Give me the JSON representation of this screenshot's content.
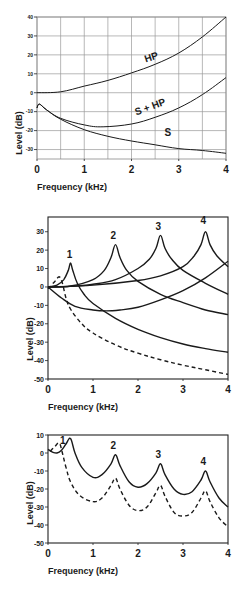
{
  "chart_data": [
    {
      "id": "top",
      "type": "line",
      "title": "",
      "xlabel": "Frequency (kHz)",
      "ylabel": "Level (dB)",
      "xlim": [
        0,
        4
      ],
      "ylim": [
        -35,
        40
      ],
      "xticks": [
        0,
        1,
        2,
        3,
        4
      ],
      "yticks": [
        40,
        30,
        20,
        10,
        0,
        -10,
        -20,
        -30
      ],
      "grid": true,
      "grid_x_step": 0.5,
      "grid_y_step": 10,
      "frame": {
        "left": 37,
        "right": 226,
        "top": 17,
        "bottom": 159
      },
      "series": [
        {
          "name": "HP",
          "style": "solid",
          "label_at": [
            2.3,
            16
          ],
          "label_rotate": -18,
          "x": [
            0,
            0.5,
            1.0,
            1.5,
            2.0,
            2.5,
            3.0,
            3.5,
            4.0
          ],
          "y": [
            0,
            0.5,
            3.5,
            6.5,
            10.5,
            15,
            21,
            29.5,
            40
          ]
        },
        {
          "name": "S + HP",
          "style": "solid",
          "label_at": [
            2.1,
            -12
          ],
          "label_rotate": -20,
          "x": [
            0,
            0.05,
            0.2,
            0.5,
            1.0,
            1.4,
            2.0,
            2.5,
            3.0,
            3.5,
            4.0
          ],
          "y": [
            -8,
            -6,
            -9,
            -13.5,
            -17,
            -18,
            -16.5,
            -13,
            -8,
            -1,
            8
          ]
        },
        {
          "name": "S",
          "style": "solid",
          "label_at": [
            2.7,
            -23
          ],
          "label_rotate": 0,
          "x": [
            0,
            0.05,
            0.2,
            0.5,
            1.0,
            1.5,
            2.0,
            2.5,
            3.0,
            3.5,
            4.0
          ],
          "y": [
            -8,
            -6,
            -9,
            -14,
            -19.5,
            -23,
            -25.5,
            -27.5,
            -29.5,
            -30.5,
            -32
          ]
        }
      ]
    },
    {
      "id": "middle",
      "type": "line",
      "title": "",
      "xlabel": "Frequency (kHz)",
      "ylabel": "Level (dB)",
      "xlim": [
        0,
        4
      ],
      "ylim": [
        -50,
        38
      ],
      "xticks": [
        0,
        1,
        2,
        3,
        4
      ],
      "yticks": [
        30,
        20,
        10,
        0,
        -10,
        -20,
        -30,
        -40,
        -50
      ],
      "grid": false,
      "frame": {
        "left": 48,
        "right": 228,
        "top": 217,
        "bottom": 379
      },
      "peak_labels": [
        {
          "text": "1",
          "x": 0.48,
          "y": 16
        },
        {
          "text": "2",
          "x": 1.45,
          "y": 26
        },
        {
          "text": "3",
          "x": 2.45,
          "y": 31
        },
        {
          "text": "4",
          "x": 3.45,
          "y": 34
        }
      ],
      "series": [
        {
          "name": "resonance 1",
          "style": "solid",
          "x": [
            0,
            0.2,
            0.35,
            0.45,
            0.5,
            0.55,
            0.65,
            0.8,
            1.0,
            1.5,
            2.0,
            2.5,
            3.0,
            3.5,
            4.0
          ],
          "y": [
            0,
            1,
            4,
            9,
            13,
            9,
            2,
            -4,
            -9,
            -17,
            -23,
            -27.5,
            -31,
            -33.5,
            -35.5
          ]
        },
        {
          "name": "resonance 2",
          "style": "solid",
          "x": [
            0,
            0.5,
            1.0,
            1.25,
            1.4,
            1.5,
            1.6,
            1.75,
            2.0,
            2.5,
            3.0,
            3.5,
            4.0
          ],
          "y": [
            0,
            0.5,
            4,
            9,
            16,
            23,
            16,
            9,
            3,
            -4,
            -8.5,
            -12.5,
            -15
          ]
        },
        {
          "name": "resonance 3",
          "style": "solid",
          "x": [
            0,
            0.5,
            1.0,
            1.5,
            2.0,
            2.25,
            2.4,
            2.5,
            2.6,
            2.75,
            3.0,
            3.5,
            4.0
          ],
          "y": [
            0,
            0.3,
            1.5,
            4,
            10,
            15,
            21,
            28,
            21,
            15,
            9,
            2,
            -4
          ]
        },
        {
          "name": "resonance 4",
          "style": "solid",
          "x": [
            0,
            1.0,
            2.0,
            2.5,
            3.0,
            3.25,
            3.4,
            3.5,
            3.6,
            3.75,
            4.0
          ],
          "y": [
            0,
            1,
            3.5,
            6,
            11,
            17,
            23,
            30,
            23,
            17,
            11
          ]
        },
        {
          "name": "radiation/high-pass",
          "style": "solid",
          "x": [
            0,
            0.3,
            0.6,
            1.0,
            1.3,
            1.6,
            2.0,
            2.5,
            3.0,
            3.5,
            4.0
          ],
          "y": [
            0,
            -6,
            -10.5,
            -12.5,
            -13,
            -12.5,
            -11,
            -7,
            -2,
            5,
            14
          ]
        },
        {
          "name": "dashed",
          "style": "dashed",
          "x": [
            0,
            0.15,
            0.25,
            0.32,
            0.4,
            0.5,
            0.75,
            1.0,
            1.5,
            2.0,
            2.5,
            3.0,
            3.5,
            4.0
          ],
          "y": [
            -1,
            3,
            5.5,
            2,
            -6,
            -12,
            -20,
            -25,
            -31.5,
            -36,
            -39.5,
            -42.5,
            -45,
            -47.5
          ]
        }
      ]
    },
    {
      "id": "bottom",
      "type": "line",
      "title": "",
      "xlabel": "Frequency  (kHz)",
      "ylabel": "Level (dB)",
      "xlim": [
        0,
        4
      ],
      "ylim": [
        -50,
        10
      ],
      "xticks": [
        0,
        1,
        2,
        3,
        4
      ],
      "yticks": [
        10,
        0,
        -10,
        -20,
        -30,
        -40,
        -50
      ],
      "grid": false,
      "frame": {
        "left": 48,
        "right": 228,
        "top": 435,
        "bottom": 543
      },
      "peak_labels": [
        {
          "text": "1",
          "x": 0.33,
          "y": 5
        },
        {
          "text": "2",
          "x": 1.45,
          "y": 2.5
        },
        {
          "text": "3",
          "x": 2.45,
          "y": -3
        },
        {
          "text": "4",
          "x": 3.45,
          "y": -6.5
        }
      ],
      "series": [
        {
          "name": "solid",
          "style": "solid",
          "x": [
            0,
            0.1,
            0.2,
            0.3,
            0.4,
            0.5,
            0.6,
            0.75,
            1.0,
            1.2,
            1.4,
            1.5,
            1.6,
            1.8,
            2.0,
            2.2,
            2.4,
            2.5,
            2.6,
            2.8,
            3.0,
            3.2,
            3.4,
            3.5,
            3.6,
            3.8,
            4.0
          ],
          "y": [
            2,
            0.5,
            0,
            1.5,
            5,
            8,
            0,
            -8,
            -13.5,
            -12,
            -6,
            -1,
            -7,
            -16,
            -19,
            -17,
            -11,
            -6,
            -12,
            -20,
            -23,
            -21.5,
            -15,
            -10,
            -16,
            -25,
            -30
          ]
        },
        {
          "name": "dashed",
          "style": "dashed",
          "x": [
            0.05,
            0.15,
            0.25,
            0.32,
            0.4,
            0.5,
            0.7,
            1.0,
            1.2,
            1.4,
            1.5,
            1.6,
            1.8,
            2.0,
            2.2,
            2.4,
            2.5,
            2.6,
            2.8,
            3.0,
            3.2,
            3.4,
            3.5,
            3.6,
            3.8,
            4.0
          ],
          "y": [
            1,
            3.5,
            5.5,
            0,
            -8,
            -16,
            -23.5,
            -27,
            -25,
            -18,
            -14,
            -20,
            -29,
            -32,
            -30,
            -22,
            -18,
            -24,
            -33,
            -35,
            -33,
            -25,
            -21,
            -27,
            -36,
            -41
          ]
        }
      ]
    }
  ]
}
